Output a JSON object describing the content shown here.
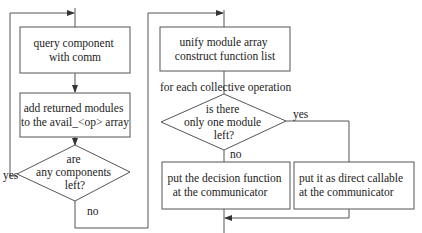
{
  "diagram": {
    "type": "flowchart",
    "line_color": "#555555",
    "text_color": "#222222",
    "left_flow": {
      "box_query": {
        "lines": [
          "query component",
          "with comm"
        ]
      },
      "box_add": {
        "lines": [
          "add returned modules",
          "to the avail_<op> array"
        ]
      },
      "decision": {
        "lines": [
          "are",
          "any components",
          "left?"
        ]
      },
      "yes_label": "yes",
      "no_label": "no"
    },
    "right_flow": {
      "box_unify": {
        "lines": [
          "unify module array",
          "construct function list"
        ]
      },
      "loop_label": "for each collective operation",
      "decision": {
        "lines": [
          "is there",
          "only one module",
          "left?"
        ]
      },
      "yes_label": "yes",
      "no_label": "no",
      "box_decision_fn": {
        "lines": [
          "put the decision function",
          "at the communicator"
        ]
      },
      "box_direct": {
        "lines": [
          "put it as direct callable",
          "at the communicator"
        ]
      }
    }
  }
}
